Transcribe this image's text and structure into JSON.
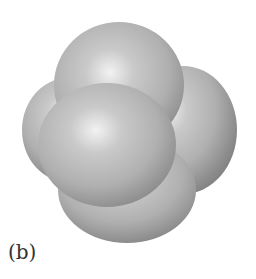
{
  "figure": {
    "label": "(b)",
    "colors": {
      "highlight": "#f2f2f2",
      "mid": "#b0b0b0",
      "shadow": "#8a8a8a",
      "edge": "#7c7c7c",
      "background": "#ffffff"
    },
    "spheres": [
      {
        "name": "right-sphere",
        "cx": 183,
        "cy": 130,
        "rx": 54,
        "ry": 64,
        "hx": 0.35,
        "hy": 0.35
      },
      {
        "name": "bottom-sphere",
        "cx": 127,
        "cy": 190,
        "rx": 69,
        "ry": 53,
        "hx": 0.45,
        "hy": 0.35
      },
      {
        "name": "left-sphere",
        "cx": 68,
        "cy": 130,
        "rx": 46,
        "ry": 52,
        "hx": 0.45,
        "hy": 0.35
      },
      {
        "name": "top-sphere",
        "cx": 119,
        "cy": 85,
        "rx": 65,
        "ry": 63,
        "hx": 0.43,
        "hy": 0.4
      },
      {
        "name": "front-sphere",
        "cx": 107,
        "cy": 145,
        "rx": 69,
        "ry": 62,
        "hx": 0.42,
        "hy": 0.38
      }
    ]
  }
}
